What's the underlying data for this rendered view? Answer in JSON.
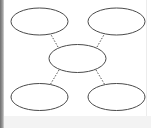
{
  "diagram": {
    "type": "mind-map",
    "colors": {
      "ellipse_stroke": "#4a4a4a",
      "connector": "#555555",
      "background": "#ffffff",
      "frame_left": "#7a7a7a"
    },
    "nodes": [
      {
        "id": "top-left",
        "label": "",
        "cx": 39.5,
        "cy": 21.5,
        "rx": 28.5,
        "ry": 13.5
      },
      {
        "id": "top-right",
        "label": "",
        "cx": 116.5,
        "cy": 21.5,
        "rx": 28.5,
        "ry": 13.5
      },
      {
        "id": "center",
        "label": "",
        "cx": 77.5,
        "cy": 58.5,
        "rx": 28.5,
        "ry": 14
      },
      {
        "id": "bottom-left",
        "label": "",
        "cx": 39.5,
        "cy": 97,
        "rx": 28.5,
        "ry": 13.5
      },
      {
        "id": "bottom-right",
        "label": "",
        "cx": 116.5,
        "cy": 97,
        "rx": 28.5,
        "ry": 13.5
      }
    ],
    "connectors": [
      {
        "from": "center",
        "to": "top-left",
        "style": "dotted"
      },
      {
        "from": "center",
        "to": "top-right",
        "style": "dotted"
      },
      {
        "from": "center",
        "to": "bottom-left",
        "style": "dotted"
      },
      {
        "from": "center",
        "to": "bottom-right",
        "style": "dotted"
      }
    ]
  }
}
